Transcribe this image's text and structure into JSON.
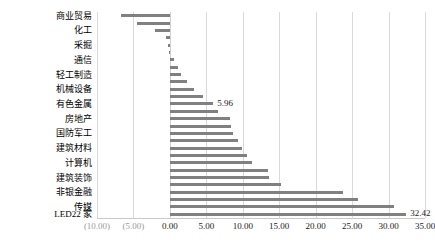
{
  "chart_data": {
    "type": "bar",
    "orientation": "horizontal",
    "title": "",
    "xlabel": "",
    "ylabel": "",
    "xlim": [
      -10,
      35
    ],
    "grid": true,
    "legend": false,
    "bar_color": "#808080",
    "xticks": [
      "(10.00)",
      "(5.00)",
      "0.00",
      "5.00",
      "10.00",
      "15.00",
      "20.00",
      "25.00",
      "30.00",
      "35.00"
    ],
    "xtick_values": [
      -10,
      -5,
      0,
      5,
      10,
      15,
      20,
      25,
      30,
      35
    ],
    "categories": [
      "商业贸易",
      "",
      "化工",
      "",
      "采掘",
      "",
      "通信",
      "",
      "轻工制造",
      "",
      "机械设备",
      "",
      "有色金属",
      "",
      "房地产",
      "",
      "国防军工",
      "",
      "建筑材料",
      "",
      "计算机",
      "",
      "建筑装饰",
      "",
      "非银金融",
      "",
      "传媒",
      "LED22 家"
    ],
    "visible_category_labels": [
      "商业贸易",
      "化工",
      "采掘",
      "通信",
      "轻工制造",
      "机械设备",
      "有色金属",
      "房地产",
      "国防军工",
      "建筑材料",
      "计算机",
      "建筑装饰",
      "非银金融",
      "传媒",
      "LED22 家"
    ],
    "values": [
      -6.7,
      -4.5,
      -2.1,
      -0.55,
      -0.25,
      -0.1,
      0.55,
      1.1,
      1.55,
      2.3,
      3.3,
      4.55,
      5.96,
      6.6,
      8.3,
      8.4,
      8.6,
      9.4,
      9.9,
      10.6,
      11.2,
      13.5,
      13.6,
      15.2,
      23.7,
      25.8,
      30.8,
      32.42
    ],
    "data_labels": [
      {
        "index": 12,
        "text": "5.96",
        "value": 5.96
      },
      {
        "index": 27,
        "text": "32.42",
        "value": 32.42
      }
    ]
  }
}
